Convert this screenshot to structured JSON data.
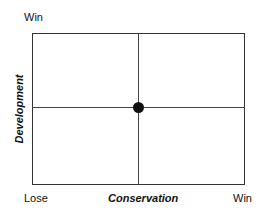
{
  "diagram": {
    "y_axis_top_label": "Win",
    "y_axis_title": "Development",
    "x_axis_left_label": "Lose",
    "x_axis_title": "Conservation",
    "x_axis_right_label": "Win",
    "point": {
      "x": 0.5,
      "y": 0.5,
      "color": "#111111"
    }
  }
}
